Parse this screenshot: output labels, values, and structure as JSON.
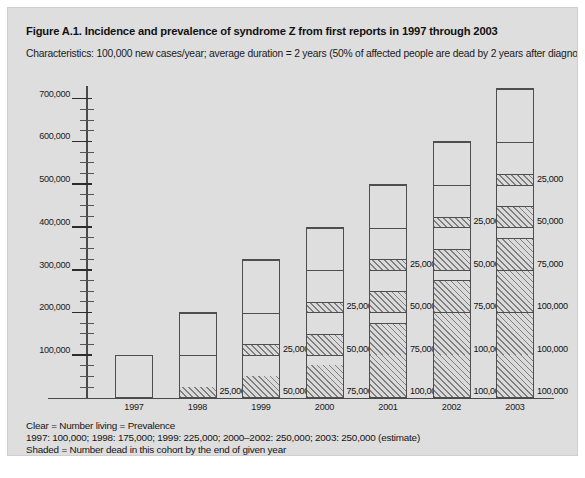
{
  "figure": {
    "title": "Figure A.1. Incidence and prevalence of syndrome Z from first reports in 1997 through 2003",
    "subtitle": "Characteristics: 100,000 new cases/year; average duration = 2 years (50% of affected people are dead by 2 years after diagnosis)"
  },
  "footer": {
    "line1": "Clear = Number living = Prevalence",
    "line2": "1997: 100,000; 1998: 175,000; 1999: 225,000; 2000–2002: 250,000; 2003: 250,000 (estimate)",
    "line3": "Shaded = Number dead in this cohort by the end of given year"
  },
  "chart_data": {
    "type": "bar",
    "title": "Figure A.1. Incidence and prevalence of syndrome Z from first reports in 1997 through 2003",
    "xlabel": "",
    "ylabel": "",
    "ylim": [
      0,
      725000
    ],
    "grid": true,
    "legend_position": "below-plot",
    "y_major_step": 100000,
    "y_minor_step": 25000,
    "y_ticks": [
      "100,000",
      "200,000",
      "300,000",
      "400,000",
      "500,000",
      "600,000",
      "700,000"
    ],
    "y_tick_values": [
      100000,
      200000,
      300000,
      400000,
      500000,
      600000,
      700000
    ],
    "categories": [
      "1997",
      "1998",
      "1999",
      "2000",
      "2001",
      "2002",
      "2003"
    ],
    "totals": [
      100000,
      200000,
      325000,
      400000,
      500000,
      600000,
      725000
    ],
    "stacking": "bottom-to-top",
    "bars": [
      {
        "category": "1997",
        "total": 100000,
        "segments": [
          {
            "value": 100000,
            "fill": "clear",
            "label": ""
          }
        ]
      },
      {
        "category": "1998",
        "total": 200000,
        "segments": [
          {
            "value": 25000,
            "fill": "shaded",
            "label": "25,000*"
          },
          {
            "value": 75000,
            "fill": "clear",
            "label": ""
          },
          {
            "value": 100000,
            "fill": "clear",
            "label": ""
          }
        ]
      },
      {
        "category": "1999",
        "total": 325000,
        "segments": [
          {
            "value": 50000,
            "fill": "shaded",
            "label": "50,000"
          },
          {
            "value": 50000,
            "fill": "clear",
            "label": ""
          },
          {
            "value": 25000,
            "fill": "shaded",
            "label": "25,000"
          },
          {
            "value": 75000,
            "fill": "clear",
            "label": ""
          },
          {
            "value": 125000,
            "fill": "clear",
            "label": ""
          }
        ]
      },
      {
        "category": "2000",
        "total": 400000,
        "segments": [
          {
            "value": 75000,
            "fill": "shaded",
            "label": "75,000"
          },
          {
            "value": 25000,
            "fill": "clear",
            "label": ""
          },
          {
            "value": 50000,
            "fill": "shaded",
            "label": "50,000"
          },
          {
            "value": 50000,
            "fill": "clear",
            "label": ""
          },
          {
            "value": 25000,
            "fill": "shaded",
            "label": "25,000"
          },
          {
            "value": 75000,
            "fill": "clear",
            "label": ""
          },
          {
            "value": 100000,
            "fill": "clear",
            "label": ""
          }
        ]
      },
      {
        "category": "2001",
        "total": 500000,
        "segments": [
          {
            "value": 100000,
            "fill": "shaded",
            "label": "100,000"
          },
          {
            "value": 75000,
            "fill": "shaded",
            "label": "75,000"
          },
          {
            "value": 25000,
            "fill": "clear",
            "label": ""
          },
          {
            "value": 50000,
            "fill": "shaded",
            "label": "50,000"
          },
          {
            "value": 50000,
            "fill": "clear",
            "label": ""
          },
          {
            "value": 25000,
            "fill": "shaded",
            "label": "25,000"
          },
          {
            "value": 75000,
            "fill": "clear",
            "label": ""
          },
          {
            "value": 100000,
            "fill": "clear",
            "label": ""
          }
        ]
      },
      {
        "category": "2002",
        "total": 600000,
        "segments": [
          {
            "value": 100000,
            "fill": "shaded",
            "label": "100,000"
          },
          {
            "value": 100000,
            "fill": "shaded",
            "label": "100,000"
          },
          {
            "value": 75000,
            "fill": "shaded",
            "label": "75,000"
          },
          {
            "value": 25000,
            "fill": "clear",
            "label": ""
          },
          {
            "value": 50000,
            "fill": "shaded",
            "label": "50,000"
          },
          {
            "value": 50000,
            "fill": "clear",
            "label": ""
          },
          {
            "value": 25000,
            "fill": "shaded",
            "label": "25,000"
          },
          {
            "value": 75000,
            "fill": "clear",
            "label": ""
          },
          {
            "value": 100000,
            "fill": "clear",
            "label": ""
          }
        ]
      },
      {
        "category": "2003",
        "total": 725000,
        "segments": [
          {
            "value": 100000,
            "fill": "shaded",
            "label": "100,000"
          },
          {
            "value": 100000,
            "fill": "shaded",
            "label": "100,000"
          },
          {
            "value": 100000,
            "fill": "shaded",
            "label": "100,000"
          },
          {
            "value": 75000,
            "fill": "shaded",
            "label": "75,000"
          },
          {
            "value": 25000,
            "fill": "clear",
            "label": ""
          },
          {
            "value": 50000,
            "fill": "shaded",
            "label": "50,000"
          },
          {
            "value": 50000,
            "fill": "clear",
            "label": ""
          },
          {
            "value": 25000,
            "fill": "shaded",
            "label": "25,000"
          },
          {
            "value": 75000,
            "fill": "clear",
            "label": ""
          },
          {
            "value": 125000,
            "fill": "clear",
            "label": ""
          }
        ]
      }
    ]
  },
  "colors": {
    "figure_background": "#dedede",
    "axis": "#4a4a4a",
    "bar_outline": "#4e4e4e",
    "text": "#111111",
    "hatch": "#000000"
  }
}
